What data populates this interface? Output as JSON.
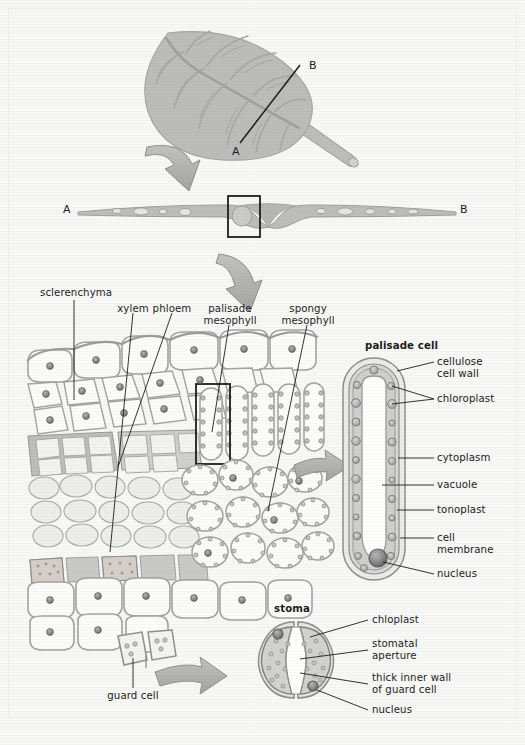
{
  "figure": {
    "background_color": "#f7f7f5",
    "ink_color": "#1d1d1d",
    "fill_mid_gray": "#b4b4b4",
    "fill_light_gray": "#d9d9d7",
    "fill_pale": "#ececea",
    "fill_white": "#fbfbfa",
    "chloroplast_color": "#9a9a9a",
    "nucleus_color": "#6f6f6f"
  },
  "panels": {
    "whole_leaf": {
      "name": "whole leaf with venation",
      "section_line_labels": {
        "start": "A",
        "end": "B"
      }
    },
    "transverse_section": {
      "name": "leaf transverse section A to B",
      "end_labels": {
        "left": "A",
        "right": "B"
      }
    },
    "tissue_detail": {
      "name": "leaf tissue cellular detail",
      "labels": [
        {
          "id": "sclerenchyma",
          "text": "sclerenchyma",
          "align": "left"
        },
        {
          "id": "xylem",
          "text": "xylem",
          "align": "center"
        },
        {
          "id": "phloem",
          "text": "phloem",
          "align": "center"
        },
        {
          "id": "palisade-mesophyll",
          "text": "palisade\nmesophyll",
          "align": "center"
        },
        {
          "id": "spongy-mesophyll",
          "text": "spongy\nmesophyll",
          "align": "center"
        },
        {
          "id": "guard-cell",
          "text": "guard cell",
          "align": "center"
        }
      ]
    },
    "palisade_cell": {
      "heading": "palisade cell",
      "labels": [
        {
          "id": "cellulose-cell-wall",
          "text": "cellulose\ncell wall"
        },
        {
          "id": "chloroplast",
          "text": "chloroplast"
        },
        {
          "id": "cytoplasm",
          "text": "cytoplasm"
        },
        {
          "id": "vacuole",
          "text": "vacuole"
        },
        {
          "id": "tonoplast",
          "text": "tonoplast"
        },
        {
          "id": "cell-membrane",
          "text": "cell\nmembrane"
        },
        {
          "id": "nucleus",
          "text": "nucleus"
        }
      ]
    },
    "stoma": {
      "heading": "stoma",
      "labels": [
        {
          "id": "chloplast",
          "text": "chloplast"
        },
        {
          "id": "stomatal-aperture",
          "text": "stomatal\naperture"
        },
        {
          "id": "thick-inner-wall",
          "text": "thick inner wall\nof guard cell"
        },
        {
          "id": "nucleus",
          "text": "nucleus"
        }
      ]
    }
  }
}
